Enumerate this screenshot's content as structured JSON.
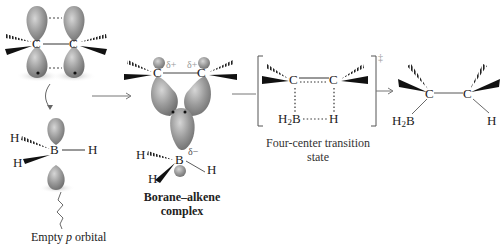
{
  "diagram": {
    "stages": [
      {
        "id": "alkene",
        "atoms": [
          "C",
          "C"
        ],
        "note": "pi orbitals (p lobes)"
      },
      {
        "id": "borane",
        "atoms": {
          "center": "B",
          "h1": "H",
          "h2": "H",
          "h3": "H"
        },
        "label": "Empty p orbital",
        "label_italic": "p"
      },
      {
        "id": "complex",
        "atoms": {
          "c1": "C",
          "c2": "C",
          "b": "B",
          "h1": "H",
          "h2": "H",
          "h3": "H"
        },
        "charges": {
          "c1": "δ+",
          "c2": "δ+",
          "b": "δ−"
        },
        "label_line1": "Borane–alkene",
        "label_line2": "complex"
      },
      {
        "id": "transition",
        "atoms": {
          "c1": "C",
          "c2": "C",
          "bh2": "H2B",
          "h": "H"
        },
        "symbol": "‡",
        "label_line1": "Four-center transition",
        "label_line2": "state"
      },
      {
        "id": "product",
        "atoms": {
          "c1": "C",
          "c2": "C",
          "bh2": "H2B",
          "h": "H"
        }
      }
    ],
    "labels": {
      "empty_p_prefix": "Empty ",
      "empty_p_italic": "p",
      "empty_p_suffix": " orbital",
      "complex_l1": "Borane–alkene",
      "complex_l2": "complex",
      "ts_l1": "Four-center transition",
      "ts_l2": "state",
      "dagger": "‡",
      "C": "C",
      "B": "B",
      "H": "H",
      "H2": "H",
      "two": "2",
      "delta_plus": "δ+",
      "delta_minus": "δ−"
    },
    "colors": {
      "lobe": "#8a8a8a",
      "lobe_light": "#c8c8c8",
      "ink": "#222222",
      "arrow": "#666666"
    }
  }
}
